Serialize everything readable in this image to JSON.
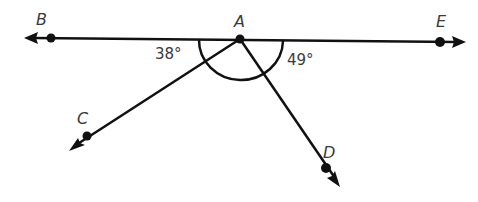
{
  "diagram": {
    "vertex": {
      "label": "A"
    },
    "rays": [
      {
        "id": "ray-ab",
        "endpoint_label": "B",
        "direction": "left"
      },
      {
        "id": "ray-ae",
        "endpoint_label": "E",
        "direction": "right"
      },
      {
        "id": "ray-ac",
        "endpoint_label": "C",
        "direction": "down-left"
      },
      {
        "id": "ray-ad",
        "endpoint_label": "D",
        "direction": "down-right"
      }
    ],
    "angles": [
      {
        "name": "angle-bac",
        "between": [
          "B",
          "C"
        ],
        "value": "38°"
      },
      {
        "name": "angle-dae",
        "between": [
          "D",
          "E"
        ],
        "value": "49°"
      }
    ],
    "arc_mark": {
      "description": "semicircular arc marking angle BAE below the line",
      "spans": [
        "B",
        "E"
      ]
    },
    "colors": {
      "stroke": "#111111",
      "text": "#3a3a3a"
    }
  }
}
